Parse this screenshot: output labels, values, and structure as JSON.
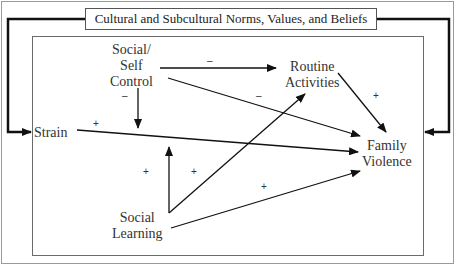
{
  "diagram": {
    "title": "Cultural and Subcultural Norms, Values, and Beliefs",
    "nodes": {
      "social_self_control": {
        "line1": "Social/",
        "line2": "Self",
        "line3": "Control"
      },
      "routine_activities": {
        "line1": "Routine",
        "line2": "Activities"
      },
      "strain": {
        "label": "Strain"
      },
      "family_violence": {
        "line1": "Family",
        "line2": "Violence"
      },
      "social_learning": {
        "line1": "Social",
        "line2": "Learning"
      }
    },
    "signs": {
      "control_to_routine": "–",
      "control_to_strain_path": "–",
      "control_to_violence": "–",
      "strain_to_violence": "+",
      "routine_to_violence": "+",
      "learning_to_strain_path": "+",
      "learning_to_routine": "+",
      "learning_to_violence": "+"
    },
    "edges": [
      {
        "from": "Social/Self Control",
        "to": "Routine Activities",
        "sign": "–"
      },
      {
        "from": "Social/Self Control",
        "to": "Family Violence",
        "sign": "–"
      },
      {
        "from": "Social/Self Control",
        "to": "Strain→Family Violence path",
        "sign": "–"
      },
      {
        "from": "Strain",
        "to": "Family Violence",
        "sign": "+"
      },
      {
        "from": "Routine Activities",
        "to": "Family Violence",
        "sign": "+"
      },
      {
        "from": "Social Learning",
        "to": "Strain→Family Violence path",
        "sign": "+"
      },
      {
        "from": "Social Learning",
        "to": "Routine Activities",
        "sign": "+"
      },
      {
        "from": "Social Learning",
        "to": "Family Violence",
        "sign": "+"
      },
      {
        "from": "Cultural and Subcultural Norms, Values, and Beliefs",
        "to": "Strain (left entry)",
        "sign": ""
      },
      {
        "from": "Cultural and Subcultural Norms, Values, and Beliefs",
        "to": "Family Violence (right entry)",
        "sign": ""
      }
    ]
  }
}
